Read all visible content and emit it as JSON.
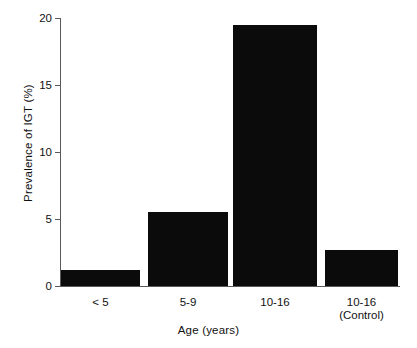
{
  "chart_data": {
    "type": "bar",
    "title": "",
    "subtitle": "",
    "xlabel": "Age  (years)",
    "ylabel": "Prevalence of IGT (%)",
    "categories": [
      "< 5",
      "5-9",
      "10-16",
      "10-16\n(Control)"
    ],
    "values": [
      1.2,
      5.5,
      19.5,
      2.7
    ],
    "ylim": [
      0,
      20
    ],
    "yticks": [
      0,
      5,
      10,
      15,
      20
    ],
    "ytick_labels": [
      "0",
      "5",
      "10",
      "15",
      "20"
    ],
    "grid": false,
    "legend": null,
    "bar_color": "#0b0b0b",
    "axis_color": "#5a5a5a",
    "background": "#ffffff"
  },
  "axis": {
    "y_title": "Prevalence of IGT (%)",
    "x_title": "Age  (years)"
  }
}
